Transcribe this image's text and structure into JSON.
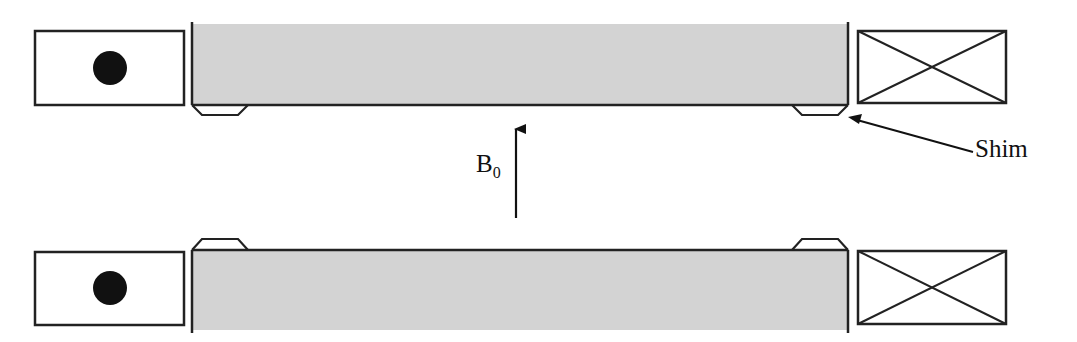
{
  "diagram": {
    "type": "magnet-cross-section",
    "labels": {
      "field_main": "B",
      "field_sub": "0",
      "shim": "Shim"
    },
    "colors": {
      "pole_fill": "#d3d3d3",
      "stroke": "#222222",
      "background": "#ffffff"
    },
    "elements": {
      "top_left_coil": "coil-current-out-of-page (dot)",
      "top_right_coil": "coil-current-into-page (cross)",
      "bottom_left_coil": "coil-current-out-of-page (dot)",
      "bottom_right_coil": "coil-current-into-page (cross)",
      "top_pole_piece": "gray pole with two shims on bottom face",
      "bottom_pole_piece": "gray pole with two shims on top face",
      "field_arrow": "upward arrow"
    }
  }
}
